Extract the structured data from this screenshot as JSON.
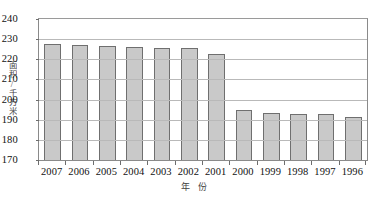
{
  "chart_data": {
    "type": "bar",
    "title": "",
    "xlabel": "年 份",
    "ylabel": "面积/千方米",
    "ylim": [
      170,
      240
    ],
    "ytick_step": 10,
    "yticks": [
      240,
      230,
      220,
      210,
      200,
      190,
      180,
      170
    ],
    "grid": true,
    "legend": "none",
    "categories": [
      "2007",
      "2006",
      "2005",
      "2004",
      "2003",
      "2002",
      "2001",
      "2000",
      "1999",
      "1998",
      "1997",
      "1996"
    ],
    "values": [
      227.5,
      227.3,
      226.5,
      226.0,
      225.8,
      225.5,
      222.5,
      195.0,
      193.5,
      193.0,
      193.0,
      191.5
    ],
    "bar_fill_color": "#c9c9c9",
    "bar_border_color": "#6f6f6f",
    "grid_color": "#b9b9b9",
    "axis_color": "#8a8a8a"
  }
}
